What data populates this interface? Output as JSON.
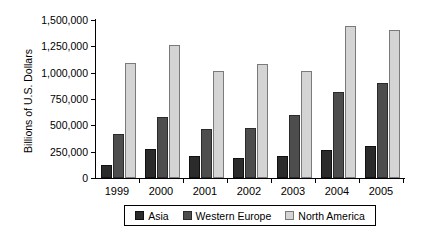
{
  "chart_data": {
    "type": "bar",
    "title": "",
    "subtitle": "",
    "xlabel": "",
    "ylabel": "Billions of U.S. Dollars",
    "categories": [
      "1999",
      "2000",
      "2001",
      "2002",
      "2003",
      "2004",
      "2005"
    ],
    "series": [
      {
        "name": "Asia",
        "color": "#2b2b2b",
        "values": [
          125000,
          280000,
          205000,
          190000,
          205000,
          270000,
          300000
        ]
      },
      {
        "name": "Western Europe",
        "color": "#4d4d4d",
        "values": [
          420000,
          580000,
          465000,
          475000,
          595000,
          820000,
          905000
        ]
      },
      {
        "name": "North America",
        "color": "#d4d4d4",
        "values": [
          1090000,
          1265000,
          1020000,
          1080000,
          1015000,
          1440000,
          1405000
        ]
      }
    ],
    "ylim": [
      0,
      1500000
    ],
    "ytick_values": [
      0,
      250000,
      500000,
      750000,
      1000000,
      1250000,
      1500000
    ],
    "ytick_labels": [
      "0",
      "250,000",
      "500,000",
      "750,000",
      "1,000,000",
      "1,250,000",
      "1,500,000"
    ],
    "grid": false,
    "legend_position": "bottom",
    "legend_entries": [
      "Asia",
      "Western Europe",
      "North America"
    ]
  }
}
